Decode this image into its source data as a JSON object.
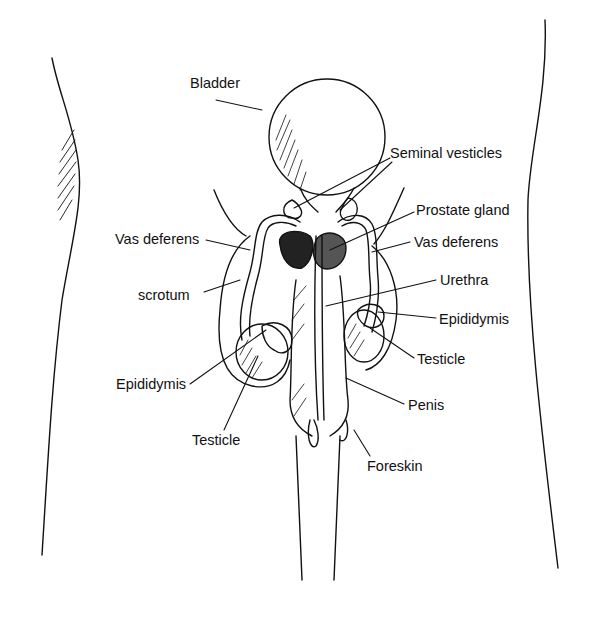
{
  "diagram": {
    "type": "anatomical-illustration",
    "labels": [
      {
        "id": "bladder",
        "text": "Bladder",
        "x": 190,
        "y": 76
      },
      {
        "id": "seminal-vesicles",
        "text": "Seminal vesticles",
        "x": 390,
        "y": 146
      },
      {
        "id": "prostate-gland",
        "text": "Prostate gland",
        "x": 416,
        "y": 203
      },
      {
        "id": "vas-deferens-left",
        "text": "Vas deferens",
        "x": 115,
        "y": 232
      },
      {
        "id": "vas-deferens-right",
        "text": "Vas deferens",
        "x": 414,
        "y": 235
      },
      {
        "id": "scrotum",
        "text": "scrotum",
        "x": 138,
        "y": 288
      },
      {
        "id": "urethra",
        "text": "Urethra",
        "x": 440,
        "y": 273
      },
      {
        "id": "epididymis-right",
        "text": "Epididymis",
        "x": 439,
        "y": 312
      },
      {
        "id": "testicle-right",
        "text": "Testicle",
        "x": 417,
        "y": 352
      },
      {
        "id": "epididymis-left",
        "text": "Epididymis",
        "x": 116,
        "y": 377
      },
      {
        "id": "penis",
        "text": "Penis",
        "x": 408,
        "y": 398
      },
      {
        "id": "testicle-left",
        "text": "Testicle",
        "x": 192,
        "y": 433
      },
      {
        "id": "foreskin",
        "text": "Foreskin",
        "x": 367,
        "y": 459
      }
    ]
  }
}
